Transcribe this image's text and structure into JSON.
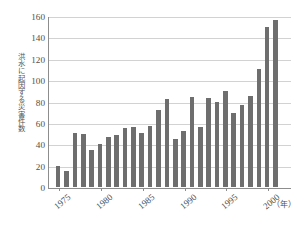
{
  "chart_data": {
    "type": "bar",
    "title": "",
    "subtitle": "",
    "xlabel": "年",
    "xlabel_display": "（年）",
    "ylabel": "洪水に起因する災害件数",
    "ylim": [
      0,
      160
    ],
    "ytick_labels": [
      "0",
      "20",
      "40",
      "60",
      "80",
      "100",
      "120",
      "140",
      "160"
    ],
    "ytick_values": [
      0,
      20,
      40,
      60,
      80,
      100,
      120,
      140,
      160
    ],
    "grid": true,
    "grid_axis": "y",
    "legend": "none",
    "bar_color": "#6e6e6e",
    "gridline_color": "#d2d2d2",
    "axis_color": "#8d8d8d",
    "categories": [
      "1975",
      "1976",
      "1977",
      "1978",
      "1979",
      "1980",
      "1981",
      "1982",
      "1983",
      "1984",
      "1985",
      "1986",
      "1987",
      "1988",
      "1989",
      "1990",
      "1991",
      "1992",
      "1993",
      "1994",
      "1995",
      "1996",
      "1997",
      "1998",
      "1999",
      "2000",
      "2001",
      "2002"
    ],
    "values": [
      20,
      15,
      51,
      50,
      35,
      40,
      47,
      49,
      55,
      56,
      51,
      57,
      72,
      82,
      45,
      52,
      84,
      56,
      83,
      80,
      90,
      69,
      77,
      85,
      110,
      150,
      156,
      0
    ],
    "xtick_labels": [
      "1975",
      "1980",
      "1985",
      "1990",
      "1995",
      "2000"
    ],
    "xtick_categories": [
      "1975",
      "1980",
      "1985",
      "1990",
      "1995",
      "2000"
    ]
  },
  "caption": {
    "text": ""
  }
}
